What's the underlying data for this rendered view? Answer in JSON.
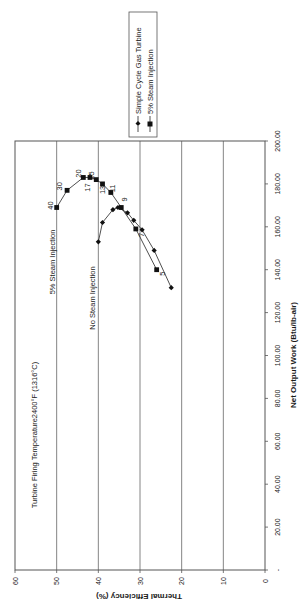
{
  "chart_data": {
    "type": "line",
    "orientation": "rotated-90-clockwise",
    "title": "",
    "xlabel": "Net Output Work (Btu/lb-air)",
    "ylabel": "Thermal Efficiency (%)",
    "xlim": [
      0,
      200
    ],
    "ylim": [
      0,
      60
    ],
    "x_ticks": [
      "-",
      "20.00",
      "40.00",
      "60.00",
      "80.00",
      "100.00",
      "120.00",
      "140.00",
      "160.00",
      "180.00",
      "200.00"
    ],
    "y_ticks": [
      "0",
      "10",
      "20",
      "30",
      "40",
      "50",
      "60"
    ],
    "grid": "horizontal gridlines at each efficiency tick",
    "legend_position": "right",
    "legend": [
      "Simple Cycle Gas Turbine",
      "5% Steam Injection"
    ],
    "annotations": [
      {
        "text": "Turbine Firing Temperature2400°F (1316°C)"
      },
      {
        "text": "5% Steam Injection"
      },
      {
        "text": "No Steam Injection"
      }
    ],
    "series": [
      {
        "name": "Simple Cycle Gas Turbine",
        "marker": "diamond",
        "points": [
          {
            "x": 131.6,
            "y": 22.5
          },
          {
            "x": 149.0,
            "y": 26.6
          },
          {
            "x": 158.6,
            "y": 29.5
          },
          {
            "x": 163.0,
            "y": 31.5
          },
          {
            "x": 166.5,
            "y": 33.0
          },
          {
            "x": 169.0,
            "y": 35.3
          },
          {
            "x": 168.0,
            "y": 36.5
          },
          {
            "x": 162.0,
            "y": 39.0
          },
          {
            "x": 153.0,
            "y": 40.0
          }
        ]
      },
      {
        "name": "5% Steam Injection",
        "marker": "square",
        "points": [
          {
            "x": 140.0,
            "y": 26.0,
            "label": "5"
          },
          {
            "x": 159.0,
            "y": 31.0,
            "label": "7"
          },
          {
            "x": 169.0,
            "y": 34.5,
            "label": "9"
          },
          {
            "x": 176.0,
            "y": 37.0,
            "label": "11"
          },
          {
            "x": 180.0,
            "y": 39.0,
            "label": "13"
          },
          {
            "x": 182.0,
            "y": 40.5,
            "label": "15"
          },
          {
            "x": 183.0,
            "y": 42.0,
            "label": "17"
          },
          {
            "x": 183.0,
            "y": 43.6,
            "label": "20"
          },
          {
            "x": 177.0,
            "y": 47.5,
            "label": "30"
          },
          {
            "x": 169.0,
            "y": 50.0,
            "label": "40"
          }
        ]
      }
    ]
  }
}
